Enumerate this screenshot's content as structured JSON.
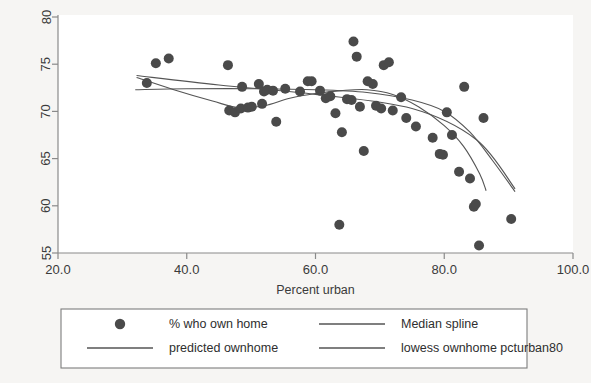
{
  "chart_data": {
    "type": "scatter",
    "title": "",
    "xlabel": "Percent urban",
    "ylabel": "",
    "xlim": [
      20.0,
      100.0
    ],
    "ylim": [
      55,
      80
    ],
    "xticks": [
      "20.0",
      "40.0",
      "60.0",
      "80.0",
      "100.0"
    ],
    "xtick_values": [
      20.0,
      40.0,
      60.0,
      80.0,
      100.0
    ],
    "yticks": [
      "55",
      "60",
      "65",
      "70",
      "75",
      "80"
    ],
    "ytick_values": [
      55,
      60,
      65,
      70,
      75,
      80
    ],
    "grid": false,
    "legend_position": "below",
    "marker_color": "#4a4a4a",
    "line_color": "#555555",
    "background_color": "#f6f5f3",
    "plot_background_color": "#ffffff",
    "series": [
      {
        "name": "% who own home",
        "type": "scatter",
        "points": [
          [
            33.8,
            73.0
          ],
          [
            35.2,
            75.1
          ],
          [
            37.2,
            75.6
          ],
          [
            46.4,
            74.9
          ],
          [
            46.6,
            70.1
          ],
          [
            47.5,
            69.9
          ],
          [
            48.6,
            72.6
          ],
          [
            48.4,
            70.3
          ],
          [
            49.5,
            70.4
          ],
          [
            50.1,
            70.5
          ],
          [
            51.2,
            72.9
          ],
          [
            51.7,
            70.8
          ],
          [
            52.0,
            72.1
          ],
          [
            52.5,
            72.3
          ],
          [
            53.4,
            72.2
          ],
          [
            53.9,
            68.9
          ],
          [
            55.3,
            72.4
          ],
          [
            57.6,
            72.1
          ],
          [
            58.8,
            73.2
          ],
          [
            59.4,
            73.2
          ],
          [
            60.7,
            72.2
          ],
          [
            61.6,
            71.4
          ],
          [
            62.3,
            71.6
          ],
          [
            63.1,
            69.8
          ],
          [
            63.7,
            58.0
          ],
          [
            64.1,
            67.8
          ],
          [
            64.9,
            71.3
          ],
          [
            65.6,
            71.2
          ],
          [
            65.9,
            77.4
          ],
          [
            66.4,
            75.8
          ],
          [
            66.9,
            70.5
          ],
          [
            67.5,
            65.8
          ],
          [
            68.1,
            73.2
          ],
          [
            68.9,
            72.9
          ],
          [
            69.4,
            70.6
          ],
          [
            70.2,
            70.3
          ],
          [
            70.6,
            74.9
          ],
          [
            71.4,
            75.2
          ],
          [
            72.0,
            70.1
          ],
          [
            73.3,
            71.5
          ],
          [
            74.1,
            69.3
          ],
          [
            75.6,
            68.4
          ],
          [
            78.2,
            67.2
          ],
          [
            79.3,
            65.5
          ],
          [
            79.8,
            65.4
          ],
          [
            80.4,
            69.9
          ],
          [
            81.2,
            67.5
          ],
          [
            82.3,
            63.6
          ],
          [
            83.1,
            72.6
          ],
          [
            84.0,
            62.9
          ],
          [
            84.6,
            59.9
          ],
          [
            84.9,
            60.2
          ],
          [
            85.4,
            55.8
          ],
          [
            86.1,
            69.3
          ],
          [
            90.4,
            58.6
          ]
        ]
      },
      {
        "name": "Median spline",
        "type": "line",
        "points": [
          [
            32.2,
            73.6
          ],
          [
            38.0,
            72.3
          ],
          [
            44.0,
            71.1
          ],
          [
            48.0,
            70.4
          ],
          [
            52.0,
            70.6
          ],
          [
            56.0,
            71.4
          ],
          [
            60.0,
            71.9
          ],
          [
            64.0,
            72.2
          ],
          [
            68.0,
            72.3
          ],
          [
            72.0,
            71.8
          ],
          [
            76.0,
            70.5
          ],
          [
            80.0,
            68.5
          ],
          [
            83.0,
            66.3
          ],
          [
            85.5,
            63.4
          ],
          [
            86.5,
            61.6
          ]
        ]
      },
      {
        "name": "predicted ownhome",
        "type": "line",
        "points": [
          [
            32.2,
            73.8
          ],
          [
            45.0,
            72.8
          ],
          [
            60.0,
            71.8
          ],
          [
            75.0,
            70.3
          ],
          [
            85.0,
            67.0
          ],
          [
            91.0,
            61.8
          ]
        ]
      },
      {
        "name": "lowess ownhome pcturban80",
        "type": "line",
        "points": [
          [
            32.0,
            72.3
          ],
          [
            40.0,
            72.4
          ],
          [
            50.0,
            72.4
          ],
          [
            60.0,
            72.3
          ],
          [
            68.0,
            72.0
          ],
          [
            75.0,
            71.2
          ],
          [
            80.0,
            70.0
          ],
          [
            84.0,
            67.8
          ],
          [
            87.5,
            64.8
          ],
          [
            91.0,
            61.5
          ]
        ]
      }
    ]
  },
  "legend": {
    "entries": [
      {
        "label": "% who own home",
        "symbol": "marker"
      },
      {
        "label": "Median spline",
        "symbol": "line"
      },
      {
        "label": "predicted ownhome",
        "symbol": "line"
      },
      {
        "label": "lowess ownhome pcturban80",
        "symbol": "line"
      }
    ]
  }
}
